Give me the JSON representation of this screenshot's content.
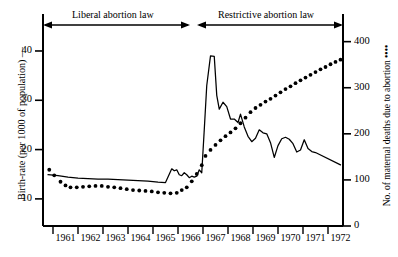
{
  "figure": {
    "background_color": "#ffffff",
    "ink_color": "#000000"
  },
  "annotations": {
    "bands": [
      {
        "name": "liberal-band",
        "label": "Liberal abortion law",
        "x_start_px": 43,
        "x_end_px": 190
      },
      {
        "name": "restrictive-band",
        "label": "Restrictive abortion law",
        "x_start_px": 197,
        "x_end_px": 343
      }
    ]
  },
  "chart_data": {
    "type": "line",
    "title": "",
    "subtitle": "",
    "xlabel": "",
    "ylabel": "Birth-rate (per 1000 of population) —",
    "ylabel_right": "No. of maternal deaths due to abortion ••••",
    "grid": false,
    "legend": "none",
    "xlim": [
      1960.6,
      1972.6
    ],
    "ylim": [
      4.5,
      47.5
    ],
    "ylim_right": [
      0,
      460
    ],
    "xtick_labels": [
      "1961",
      "1962",
      "1963",
      "1964",
      "1965",
      "1966",
      "1967",
      "1968",
      "1969",
      "1970",
      "1971",
      "1972"
    ],
    "ytick_labels_left": [
      "40",
      "30",
      "20",
      "10"
    ],
    "ytick_values_left": [
      40,
      30,
      20,
      10
    ],
    "ytick_labels_right": [
      "400",
      "300",
      "200",
      "100",
      "0"
    ],
    "ytick_values_right": [
      400,
      300,
      200,
      100,
      0
    ],
    "series": [
      {
        "name": "Birth-rate (per 1000 of population)",
        "style": "solid-line",
        "axis": "left",
        "x": [
          1960.8,
          1961.2,
          1961.6,
          1962.0,
          1962.4,
          1962.8,
          1963.2,
          1963.6,
          1964.0,
          1964.4,
          1964.8,
          1965.2,
          1965.5,
          1965.75,
          1965.85,
          1965.95,
          1966.05,
          1966.15,
          1966.25,
          1966.35,
          1966.45,
          1966.55,
          1966.65,
          1966.75,
          1966.85,
          1966.95,
          1967.05,
          1967.15,
          1967.3,
          1967.45,
          1967.55,
          1967.65,
          1967.8,
          1967.95,
          1968.1,
          1968.25,
          1968.4,
          1968.5,
          1968.65,
          1968.8,
          1968.95,
          1969.1,
          1969.25,
          1969.4,
          1969.55,
          1969.7,
          1969.85,
          1970.0,
          1970.15,
          1970.3,
          1970.45,
          1970.6,
          1970.75,
          1970.9,
          1971.05,
          1971.2,
          1971.35,
          1971.5,
          1972.5
        ],
        "y": [
          14.9,
          14.7,
          14.4,
          14.2,
          14.1,
          14.0,
          14.0,
          13.9,
          13.8,
          13.7,
          13.6,
          13.4,
          13.3,
          16.1,
          15.7,
          15.9,
          14.9,
          14.7,
          15.3,
          14.9,
          14.3,
          14.6,
          14.4,
          14.6,
          15.9,
          15.3,
          24.0,
          33.0,
          39.0,
          38.9,
          31.0,
          28.2,
          29.6,
          28.7,
          26.2,
          26.2,
          25.5,
          27.2,
          24.6,
          22.7,
          21.6,
          22.3,
          24.0,
          23.4,
          23.2,
          21.4,
          18.4,
          20.8,
          22.2,
          22.5,
          22.1,
          21.2,
          19.5,
          19.9,
          22.0,
          20.2,
          19.6,
          19.4,
          16.9
        ]
      },
      {
        "name": "No. of maternal deaths due to abortion",
        "style": "dotted",
        "axis": "right",
        "x": [
          1960.85,
          1961.05,
          1961.3,
          1961.5,
          1961.7,
          1961.95,
          1962.2,
          1962.45,
          1962.7,
          1962.95,
          1963.2,
          1963.45,
          1963.7,
          1963.95,
          1964.2,
          1964.45,
          1964.7,
          1964.95,
          1965.2,
          1965.45,
          1965.7,
          1965.95,
          1966.15,
          1966.35,
          1966.55,
          1966.75,
          1966.95,
          1967.1,
          1967.3,
          1967.5,
          1967.7,
          1967.9,
          1968.1,
          1968.3,
          1968.5,
          1968.7,
          1968.9,
          1969.1,
          1969.3,
          1969.5,
          1969.7,
          1969.9,
          1970.1,
          1970.3,
          1970.5,
          1970.7,
          1970.9,
          1971.1,
          1971.3,
          1971.5,
          1971.7,
          1971.9,
          1972.1,
          1972.3,
          1972.5
        ],
        "y": [
          122,
          110,
          96,
          88,
          84,
          84,
          85,
          86,
          87,
          87,
          85,
          84,
          82,
          80,
          78,
          77,
          76,
          75,
          73,
          72,
          71,
          72,
          78,
          84,
          97,
          113,
          132,
          152,
          165,
          176,
          186,
          195,
          203,
          212,
          223,
          235,
          247,
          256,
          263,
          270,
          276,
          283,
          290,
          297,
          303,
          310,
          316,
          322,
          328,
          334,
          340,
          345,
          351,
          356,
          361
        ]
      }
    ]
  }
}
